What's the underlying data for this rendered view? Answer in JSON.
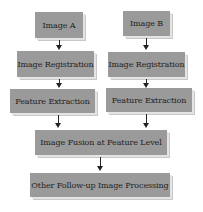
{
  "diagram": {
    "type": "flowchart",
    "left_column": {
      "input": "Image A",
      "registration": "Image Registration",
      "extraction": "Feature Extraction"
    },
    "right_column": {
      "input": "Image B",
      "registration": "Image Registration",
      "extraction": "Feature Extraction"
    },
    "fusion": "Image Fusion at Feature Level",
    "followup": "Other Follow-up Image Processing",
    "colors": {
      "box_fill": "#9a9a9a",
      "text": "#222222",
      "arrow": "#222222"
    }
  }
}
